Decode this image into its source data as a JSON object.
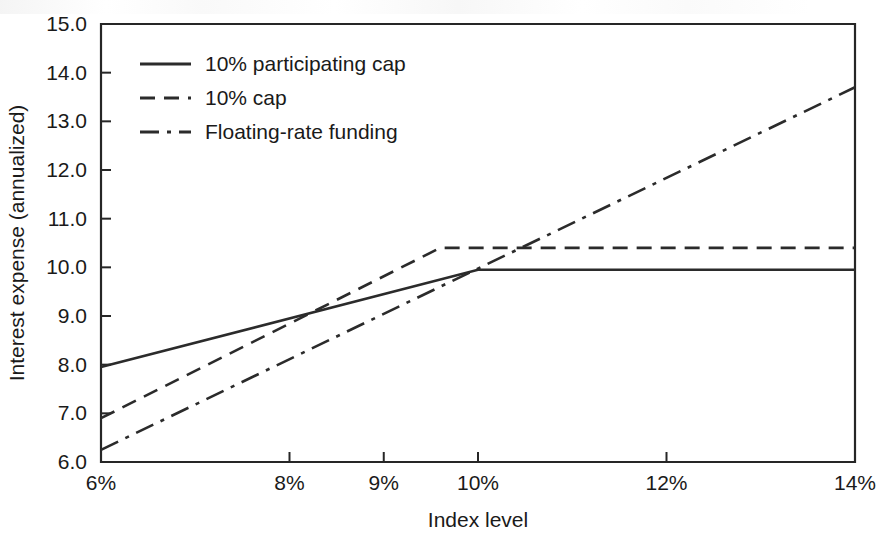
{
  "chart_data": {
    "type": "line",
    "title": "",
    "xlabel": "Index level",
    "ylabel": "Interest expense (annualized)",
    "xlim": [
      6,
      14
    ],
    "ylim": [
      6.0,
      15.0
    ],
    "grid": false,
    "legend_position": "top-left-inside",
    "x_tick_labels": [
      "6%",
      "8%",
      "9%",
      "10%",
      "12%",
      "14%"
    ],
    "x_tick_values": [
      6,
      8,
      9,
      10,
      12,
      14
    ],
    "y_tick_labels": [
      "6.0",
      "7.0",
      "8.0",
      "9.0",
      "10.0",
      "11.0",
      "12.0",
      "13.0",
      "14.0",
      "15.0"
    ],
    "y_tick_values": [
      6.0,
      7.0,
      8.0,
      9.0,
      10.0,
      11.0,
      12.0,
      13.0,
      14.0,
      15.0
    ],
    "series": [
      {
        "name": "10% participating cap",
        "style": "solid",
        "x": [
          6,
          10,
          14
        ],
        "values": [
          7.95,
          9.95,
          9.95
        ]
      },
      {
        "name": "10% cap",
        "style": "dashed",
        "x": [
          6,
          9.6,
          14
        ],
        "values": [
          6.9,
          10.4,
          10.4
        ]
      },
      {
        "name": "Floating-rate funding",
        "style": "dash-dot",
        "x": [
          6,
          14
        ],
        "values": [
          6.25,
          13.7
        ]
      }
    ]
  },
  "legend": {
    "items": [
      {
        "label": "10% participating cap",
        "style": "solid"
      },
      {
        "label": "10% cap",
        "style": "dashed"
      },
      {
        "label": "Floating-rate funding",
        "style": "dash-dot"
      }
    ]
  },
  "colors": {
    "ink": "#2b2b2b",
    "text": "#1a1a1a",
    "background": "#ffffff"
  }
}
